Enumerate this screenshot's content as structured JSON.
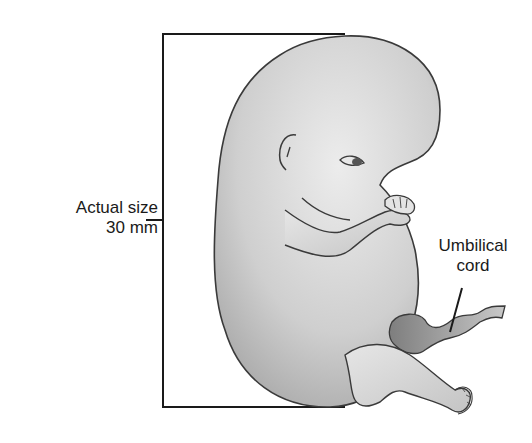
{
  "figure": {
    "labels": {
      "size_line1": "Actual size",
      "size_line2": "30 mm",
      "cord_line1": "Umbilical",
      "cord_line2": "cord"
    },
    "colors": {
      "outline": "#3a3a3a",
      "body_light": "#e2e2e2",
      "body_dark": "#a9a9a9",
      "cord": "#8e8e8e",
      "bracket": "#1a1a1a"
    }
  }
}
